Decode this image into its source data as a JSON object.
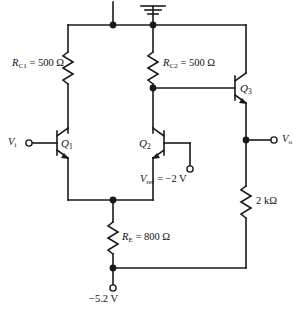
{
  "diagram": {
    "type": "circuit-schematic",
    "ground_symbol": "earth-ground",
    "line_color": "#1a1a1a",
    "background_color": "#ffffff"
  },
  "components": {
    "rc1": {
      "name": "R",
      "subscript": "C1",
      "equals": " = ",
      "value": "500 Ω",
      "full": "R_C1 = 500 Ω"
    },
    "rc2": {
      "name": "R",
      "subscript": "C2",
      "equals": " = ",
      "value": "500 Ω",
      "full": "R_C2 = 500 Ω"
    },
    "re": {
      "name": "R",
      "subscript": "E",
      "equals": " = ",
      "value": "800 Ω",
      "full": "R_E = 800 Ω"
    },
    "rl": {
      "name": "",
      "subscript": "",
      "equals": "",
      "value": "2 kΩ",
      "full": "2 kΩ"
    },
    "q1": {
      "name": "Q",
      "subscript": "1",
      "full": "Q1"
    },
    "q2": {
      "name": "Q",
      "subscript": "2",
      "full": "Q2"
    },
    "q3": {
      "name": "Q",
      "subscript": "3",
      "full": "Q3"
    }
  },
  "terminals": {
    "input": {
      "name": "V",
      "subscript": "i",
      "full": "Vi"
    },
    "output": {
      "name": "V",
      "subscript": "o",
      "full": "Vo"
    },
    "vref": {
      "name": "V",
      "subscript": "ref",
      "equals": " = ",
      "value": "−2 V",
      "full": "Vref = −2 V"
    },
    "supply": {
      "value": "−5.2 V",
      "full": "−5.2 V"
    }
  }
}
